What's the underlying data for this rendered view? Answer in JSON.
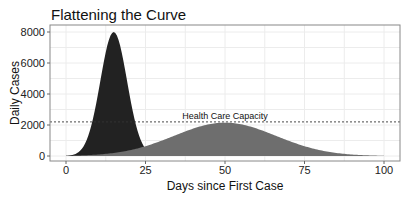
{
  "chart_data": {
    "type": "area",
    "title": "Flattening the Curve",
    "xlabel": "Days since First Case",
    "ylabel": "Daily Cases",
    "xlim": [
      -5,
      105
    ],
    "ylim": [
      -300,
      8400
    ],
    "x_ticks": [
      0,
      25,
      50,
      75,
      100
    ],
    "y_ticks": [
      0,
      2000,
      4000,
      6000,
      8000
    ],
    "grid": true,
    "series": [
      {
        "name": "Without measures",
        "color": "#222222",
        "shape": "gaussian",
        "peak_day": 15,
        "peak_cases": 8000,
        "sigma_days": 4.2,
        "x_range": [
          0,
          25
        ]
      },
      {
        "name": "With measures",
        "color": "#6e6e6e",
        "shape": "gaussian",
        "peak_day": 50,
        "peak_cases": 2150,
        "sigma_days": 16,
        "x_range": [
          0,
          100
        ]
      }
    ],
    "annotations": [
      {
        "type": "hline",
        "y": 2200,
        "style": "dashed",
        "label": "Health Care Capacity",
        "label_x": 50
      }
    ]
  }
}
